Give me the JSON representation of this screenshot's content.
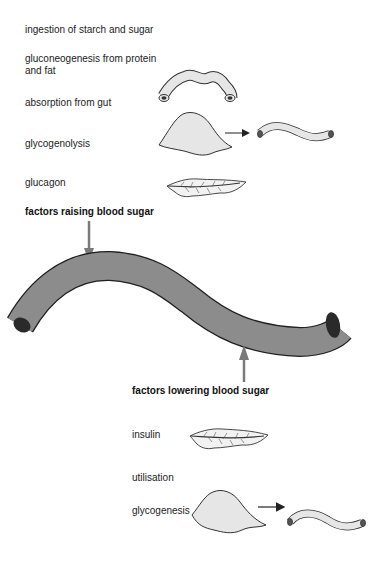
{
  "raising": {
    "heading": "factors raising blood sugar",
    "items": [
      {
        "label": "ingestion of starch and sugar"
      },
      {
        "label": "gluconeogenesis from protein and fat"
      },
      {
        "label": "absorption from gut",
        "icon": "intestine-icon"
      },
      {
        "label": "glycogenolysis",
        "icon": "liver-to-vessel-icon"
      },
      {
        "label": "glucagon",
        "icon": "pancreas-icon"
      }
    ]
  },
  "lowering": {
    "heading": "factors lowering blood sugar",
    "items": [
      {
        "label": "insulin",
        "icon": "pancreas-icon"
      },
      {
        "label": "utilisation"
      },
      {
        "label": "glycogenesis",
        "icon": "liver-to-vessel-icon"
      }
    ]
  },
  "colors": {
    "vessel_fill": "#8c8c8c",
    "vessel_end": "#2a2a2a",
    "organ_fill": "#e6e6e6",
    "arrow": "#7a7a7a",
    "text": "#222222"
  }
}
